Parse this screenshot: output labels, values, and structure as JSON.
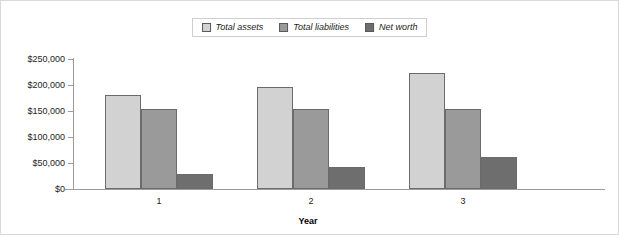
{
  "chart_data": {
    "type": "bar",
    "title": "",
    "xlabel": "Year",
    "ylabel": "",
    "categories": [
      "1",
      "2",
      "3"
    ],
    "series": [
      {
        "name": "Total assets",
        "values": [
          180000,
          196000,
          224000
        ],
        "color": "#d2d2d2"
      },
      {
        "name": "Total liabilities",
        "values": [
          153000,
          153000,
          154000
        ],
        "color": "#9a9a9a"
      },
      {
        "name": "Net worth",
        "values": [
          28000,
          42000,
          62000
        ],
        "color": "#6e6e6e"
      }
    ],
    "ylim": [
      0,
      250000
    ],
    "ytick_values": [
      250000,
      200000,
      150000,
      100000,
      50000,
      0
    ],
    "ytick_labels": [
      "$250,000",
      "$200,000",
      "$150,000",
      "$100,000",
      "$50,000",
      "$0"
    ],
    "grid": false,
    "legend_position": "top-center",
    "bar_border_color": "#6b6b6b",
    "axis_color": "#9c9c9c"
  }
}
